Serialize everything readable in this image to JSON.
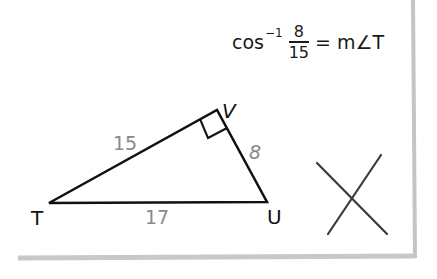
{
  "formula": {
    "function": "cos",
    "exponent": "−1",
    "numerator": "8",
    "denominator": "15",
    "equals": "=",
    "rhs": "m∠T"
  },
  "triangle": {
    "vertices": {
      "T": "T",
      "U": "U",
      "V": "V"
    },
    "sides": {
      "TV": "15",
      "VU": "8",
      "TU": "17"
    },
    "right_angle_at": "V"
  },
  "mark": {
    "type": "cross-out-icon",
    "meaning": "incorrect"
  },
  "colors": {
    "stroke": "#111111",
    "side_label": "#8a8a8a",
    "cross": "#3a3a3a",
    "border_shadow": "#c8c8c8"
  }
}
